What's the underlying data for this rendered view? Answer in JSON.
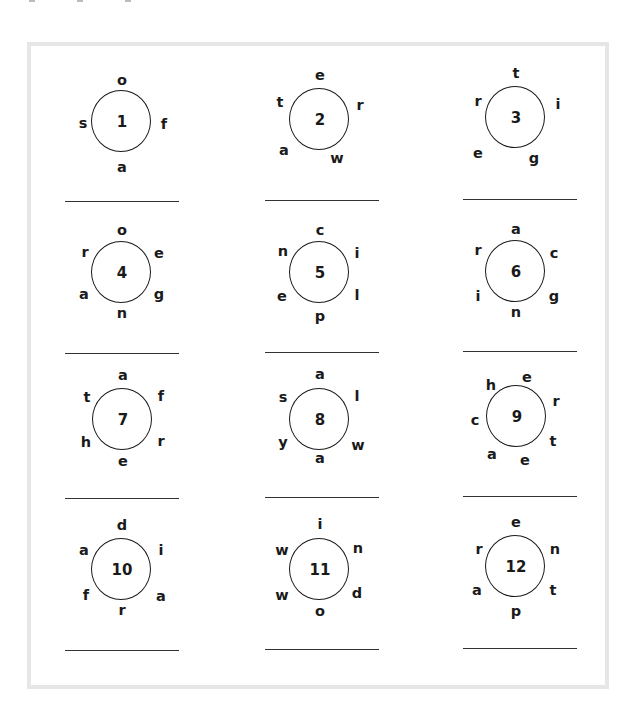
{
  "worksheet": {
    "title": "",
    "accent_colors": {
      "frame_border": "#e6e6e6",
      "ink": "#1a1a1a",
      "answer_line": "#333333"
    },
    "puzzles": [
      {
        "number": "1",
        "center": [
          122,
          122
        ],
        "line": [
          65,
          201,
          114
        ],
        "letters": [
          {
            "ch": "o",
            "dx": 0,
            "dy": -42
          },
          {
            "ch": "s",
            "dx": -39,
            "dy": 1
          },
          {
            "ch": "f",
            "dx": 42,
            "dy": 2
          },
          {
            "ch": "a",
            "dx": 0,
            "dy": 45
          }
        ]
      },
      {
        "number": "2",
        "center": [
          320,
          120
        ],
        "line": [
          265,
          200,
          114
        ],
        "letters": [
          {
            "ch": "e",
            "dx": 0,
            "dy": -45
          },
          {
            "ch": "t",
            "dx": -40,
            "dy": -18
          },
          {
            "ch": "r",
            "dx": 40,
            "dy": -15
          },
          {
            "ch": "a",
            "dx": -36,
            "dy": 30
          },
          {
            "ch": "w",
            "dx": 17,
            "dy": 38
          }
        ]
      },
      {
        "number": "3",
        "center": [
          516,
          118
        ],
        "line": [
          463,
          199,
          114
        ],
        "letters": [
          {
            "ch": "t",
            "dx": 0,
            "dy": -45
          },
          {
            "ch": "r",
            "dx": -38,
            "dy": -17
          },
          {
            "ch": "i",
            "dx": 42,
            "dy": -14
          },
          {
            "ch": "e",
            "dx": -38,
            "dy": 35
          },
          {
            "ch": "g",
            "dx": 18,
            "dy": 40
          }
        ]
      },
      {
        "number": "4",
        "center": [
          122,
          273
        ],
        "line": [
          65,
          353,
          114
        ],
        "letters": [
          {
            "ch": "o",
            "dx": 0,
            "dy": -43
          },
          {
            "ch": "r",
            "dx": -37,
            "dy": -21
          },
          {
            "ch": "e",
            "dx": 37,
            "dy": -20
          },
          {
            "ch": "a",
            "dx": -38,
            "dy": 21
          },
          {
            "ch": "g",
            "dx": 37,
            "dy": 21
          },
          {
            "ch": "n",
            "dx": 0,
            "dy": 40
          }
        ]
      },
      {
        "number": "5",
        "center": [
          320,
          273
        ],
        "line": [
          265,
          352,
          114
        ],
        "letters": [
          {
            "ch": "c",
            "dx": 0,
            "dy": -43
          },
          {
            "ch": "n",
            "dx": -37,
            "dy": -22
          },
          {
            "ch": "i",
            "dx": 37,
            "dy": -20
          },
          {
            "ch": "e",
            "dx": -38,
            "dy": 23
          },
          {
            "ch": "l",
            "dx": 37,
            "dy": 22
          },
          {
            "ch": "p",
            "dx": 0,
            "dy": 43
          }
        ]
      },
      {
        "number": "6",
        "center": [
          516,
          272
        ],
        "line": [
          463,
          351,
          114
        ],
        "letters": [
          {
            "ch": "a",
            "dx": 0,
            "dy": -43
          },
          {
            "ch": "r",
            "dx": -38,
            "dy": -22
          },
          {
            "ch": "c",
            "dx": 38,
            "dy": -19
          },
          {
            "ch": "i",
            "dx": -38,
            "dy": 24
          },
          {
            "ch": "g",
            "dx": 38,
            "dy": 24
          },
          {
            "ch": "n",
            "dx": 0,
            "dy": 40
          }
        ]
      },
      {
        "number": "7",
        "center": [
          123,
          420
        ],
        "line": [
          65,
          498,
          114
        ],
        "letters": [
          {
            "ch": "a",
            "dx": 0,
            "dy": -45
          },
          {
            "ch": "t",
            "dx": -36,
            "dy": -23
          },
          {
            "ch": "f",
            "dx": 38,
            "dy": -24
          },
          {
            "ch": "h",
            "dx": -37,
            "dy": 22
          },
          {
            "ch": "r",
            "dx": 38,
            "dy": 21
          },
          {
            "ch": "e",
            "dx": 0,
            "dy": 41
          }
        ]
      },
      {
        "number": "8",
        "center": [
          320,
          420
        ],
        "line": [
          265,
          497,
          114
        ],
        "letters": [
          {
            "ch": "a",
            "dx": 0,
            "dy": -46
          },
          {
            "ch": "s",
            "dx": -37,
            "dy": -23
          },
          {
            "ch": "l",
            "dx": 37,
            "dy": -24
          },
          {
            "ch": "y",
            "dx": -37,
            "dy": 22
          },
          {
            "ch": "w",
            "dx": 38,
            "dy": 25
          },
          {
            "ch": "a",
            "dx": 0,
            "dy": 38
          }
        ]
      },
      {
        "number": "9",
        "center": [
          517,
          417
        ],
        "line": [
          463,
          496,
          114
        ],
        "letters": [
          {
            "ch": "h",
            "dx": -26,
            "dy": -32
          },
          {
            "ch": "e",
            "dx": 10,
            "dy": -40
          },
          {
            "ch": "r",
            "dx": 39,
            "dy": -16
          },
          {
            "ch": "t",
            "dx": 36,
            "dy": 24
          },
          {
            "ch": "e",
            "dx": 8,
            "dy": 43
          },
          {
            "ch": "a",
            "dx": -25,
            "dy": 37
          },
          {
            "ch": "c",
            "dx": -42,
            "dy": 3
          }
        ]
      },
      {
        "number": "10",
        "center": [
          122,
          570
        ],
        "line": [
          65,
          650,
          114
        ],
        "letters": [
          {
            "ch": "d",
            "dx": 0,
            "dy": -45
          },
          {
            "ch": "a",
            "dx": -38,
            "dy": -20
          },
          {
            "ch": "i",
            "dx": 39,
            "dy": -20
          },
          {
            "ch": "f",
            "dx": -36,
            "dy": 25
          },
          {
            "ch": "a",
            "dx": 39,
            "dy": 26
          },
          {
            "ch": "r",
            "dx": 0,
            "dy": 40
          }
        ]
      },
      {
        "number": "11",
        "center": [
          320,
          570
        ],
        "line": [
          265,
          649,
          114
        ],
        "letters": [
          {
            "ch": "i",
            "dx": 0,
            "dy": -46
          },
          {
            "ch": "w",
            "dx": -38,
            "dy": -20
          },
          {
            "ch": "n",
            "dx": 38,
            "dy": -22
          },
          {
            "ch": "w",
            "dx": -38,
            "dy": 25
          },
          {
            "ch": "d",
            "dx": 37,
            "dy": 23
          },
          {
            "ch": "o",
            "dx": 0,
            "dy": 41
          }
        ]
      },
      {
        "number": "12",
        "center": [
          516,
          567
        ],
        "line": [
          463,
          648,
          114
        ],
        "letters": [
          {
            "ch": "e",
            "dx": 0,
            "dy": -45
          },
          {
            "ch": "r",
            "dx": -37,
            "dy": -18
          },
          {
            "ch": "n",
            "dx": 39,
            "dy": -18
          },
          {
            "ch": "a",
            "dx": -39,
            "dy": 23
          },
          {
            "ch": "t",
            "dx": 37,
            "dy": 23
          },
          {
            "ch": "p",
            "dx": 0,
            "dy": 44
          }
        ]
      }
    ]
  }
}
